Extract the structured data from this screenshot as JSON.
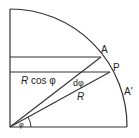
{
  "diagram": {
    "type": "geometry",
    "stroke_color": "#333333",
    "labels": {
      "point_a": "A",
      "point_p": "P",
      "point_a_prime": "A'",
      "r_cos_phi_r": "R",
      "r_cos_phi_rest": " cos φ",
      "d_phi": "dφ",
      "radius": "R",
      "angle": "φ"
    }
  }
}
